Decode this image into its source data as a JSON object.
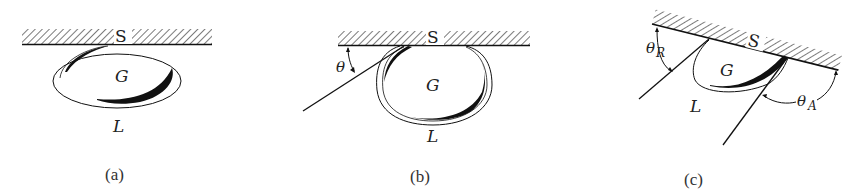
{
  "figure": {
    "panels": [
      {
        "id": "a",
        "caption": "(a)",
        "surface_label": "S",
        "gas_label": "G",
        "liquid_label": "L",
        "description": "Flattened gas bubble G in liquid film L resting against horizontal solid surface S"
      },
      {
        "id": "b",
        "caption": "(b)",
        "surface_label": "S",
        "gas_label": "G",
        "liquid_label": "L",
        "angle_label": "θ",
        "description": "Bubble with contact angle θ measured between surface S and tangent line"
      },
      {
        "id": "c",
        "caption": "(c)",
        "surface_label": "S",
        "gas_label": "G",
        "liquid_label": "L",
        "angle_receding_label": "θ",
        "angle_receding_sub": "R",
        "angle_advancing_label": "θ",
        "angle_advancing_sub": "A",
        "description": "Bubble on tilted surface with receding angle θR and advancing angle θA"
      }
    ],
    "colors": {
      "ink": "#111111",
      "background": "#ffffff"
    }
  }
}
